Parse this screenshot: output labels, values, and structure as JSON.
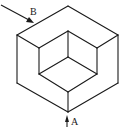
{
  "diagram": {
    "type": "isometric-view",
    "labels": {
      "A": "A",
      "B": "B"
    },
    "colors": {
      "line": "#1a1a1a",
      "background": "#ffffff"
    }
  }
}
